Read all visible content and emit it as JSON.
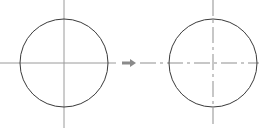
{
  "canvas": {
    "width": 259,
    "height": 128,
    "background_color": "#ffffff",
    "title": "Circle with solid crosshair transformed to circle with dash-dot centerlines"
  },
  "colors": {
    "circle_outline": "#3a3a3a",
    "solid_axis": "#9a9a9a",
    "centerline_axis": "#8f8f8f",
    "arrow": "#8a8a8a",
    "background": "#ffffff"
  },
  "figures": [
    {
      "id": "left-figure",
      "name": "circle-with-solid-crosshair",
      "circle": {
        "cx": 64,
        "cy": 63,
        "r": 44,
        "stroke_width": 1,
        "fill": "none"
      },
      "axes": [
        {
          "name": "horizontal-axis",
          "orientation": "horizontal",
          "x1": 0,
          "y1": 63,
          "x2": 116,
          "y2": 63,
          "style": "solid"
        },
        {
          "name": "vertical-axis",
          "orientation": "vertical",
          "x1": 64,
          "y1": 0,
          "x2": 64,
          "y2": 128,
          "style": "solid"
        }
      ]
    },
    {
      "id": "right-figure",
      "name": "circle-with-dash-dot-centerlines",
      "circle": {
        "cx": 213,
        "cy": 63,
        "r": 44,
        "stroke_width": 1,
        "fill": "none"
      },
      "axes": [
        {
          "name": "horizontal-centerline",
          "orientation": "horizontal",
          "x1": 140,
          "y1": 63,
          "x2": 259,
          "y2": 63,
          "style": "dash-dot",
          "dash_pattern": "16 4 3 4"
        },
        {
          "name": "vertical-centerline",
          "orientation": "vertical",
          "x1": 213,
          "y1": 0,
          "x2": 213,
          "y2": 128,
          "style": "dash-dot",
          "dash_pattern": "16 4 3 4"
        }
      ]
    }
  ],
  "connector": {
    "name": "transformation-arrow",
    "direction": "right",
    "shaft": {
      "x1": 122,
      "y1": 63,
      "x2": 131,
      "y2": 63
    },
    "head": {
      "tip_x": 136,
      "tip_y": 63,
      "base_x": 130,
      "half_height": 4
    },
    "stroke_width": 3
  }
}
